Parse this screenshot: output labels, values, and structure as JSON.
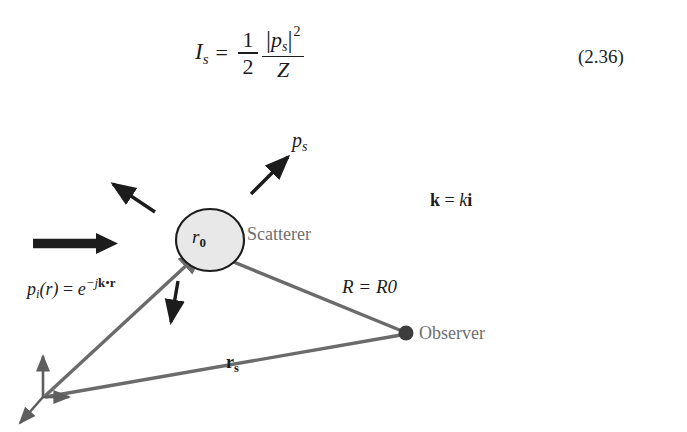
{
  "page": {
    "width": 687,
    "height": 432,
    "background": "#ffffff"
  },
  "equation": {
    "lhs_symbol": "I",
    "lhs_subscript": "s",
    "equals": "=",
    "fraction_half_numerator": "1",
    "fraction_half_denominator": "2",
    "numerator_symbol": "p",
    "numerator_subscript": "s",
    "numerator_exponent": "2",
    "abs_bar": "|",
    "denominator": "Z",
    "number": "(2.36)"
  },
  "diagram": {
    "labels": {
      "scattered_wave": "p",
      "scattered_wave_sub": "s",
      "scatterer_radius": "r",
      "scatterer_radius_sub": "0",
      "scatterer_name": "Scatterer",
      "wavevector_k_bold": "k",
      "wavevector_equals": "=",
      "wavevector_k_italic": "k",
      "wavevector_i_bold": "i",
      "incident_p": "p",
      "incident_p_sub": "i",
      "incident_r_arg": "(r)",
      "incident_equals": "=",
      "incident_e": "e",
      "incident_exp_minus_j": "−j",
      "incident_exp_k": "k",
      "incident_exp_dot": "•",
      "incident_exp_r": "r",
      "range_label": "R = R0",
      "observer_name": "Observer",
      "position_vector": "r",
      "position_vector_sub": "s"
    },
    "colors": {
      "ink": "#1c1c1c",
      "gray_line": "#6b6b6b",
      "gray_text": "#6f6f6f",
      "scatterer_fill": "#e8e8e8",
      "scatterer_stroke": "#1c1c1c",
      "observer_dot": "#3d3d3d"
    },
    "geometry": {
      "origin_x": 43,
      "origin_y": 398,
      "scatterer_cx": 210,
      "scatterer_cy": 240,
      "scatterer_rx": 34,
      "scatterer_ry": 31,
      "observer_x": 406,
      "observer_y": 333,
      "observer_dot_radius": 7
    }
  }
}
